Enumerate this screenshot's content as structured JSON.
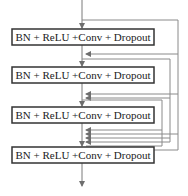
{
  "diagram": {
    "type": "dense-block",
    "blocks": [
      {
        "label": "BN + ReLU +Conv + Dropout"
      },
      {
        "label": "BN + ReLU +Conv + Dropout"
      },
      {
        "label": "BN + ReLU +Conv + Dropout"
      },
      {
        "label": "BN + ReLU +Conv + Dropout"
      }
    ],
    "colors": {
      "line": "#7a7a7a",
      "box_border": "#333333",
      "text": "#222222"
    }
  }
}
